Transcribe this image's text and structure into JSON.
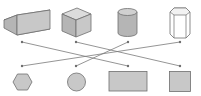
{
  "diagram": {
    "type": "matching",
    "corner_text": "",
    "colors": {
      "fill": "#c8c8c8",
      "fill_dark": "#a9a9a9",
      "fill_light": "#dcdcdc",
      "stroke": "#6e6e6e",
      "line": "#7a7a7a",
      "prism_fill": "#ffffff"
    },
    "solids": [
      {
        "id": "cuboid",
        "label": "rectangular prism"
      },
      {
        "id": "cube",
        "label": "cube"
      },
      {
        "id": "cylinder",
        "label": "cylinder"
      },
      {
        "id": "hex-prism",
        "label": "hexagonal prism"
      }
    ],
    "faces": [
      {
        "id": "hexagon",
        "label": "hexagon"
      },
      {
        "id": "circle",
        "label": "circle"
      },
      {
        "id": "rectangle",
        "label": "rectangle"
      },
      {
        "id": "square",
        "label": "square"
      }
    ],
    "top_dots": [
      [
        22,
        42
      ],
      [
        76,
        42
      ],
      [
        128,
        42
      ],
      [
        180,
        42
      ]
    ],
    "bottom_dots": [
      [
        22,
        66
      ],
      [
        76,
        66
      ],
      [
        128,
        66
      ],
      [
        180,
        66
      ]
    ],
    "connections": [
      {
        "from": "cuboid",
        "to": "rectangle"
      },
      {
        "from": "cube",
        "to": "square"
      },
      {
        "from": "cylinder",
        "to": "circle"
      },
      {
        "from": "hex-prism",
        "to": "hexagon"
      }
    ]
  }
}
